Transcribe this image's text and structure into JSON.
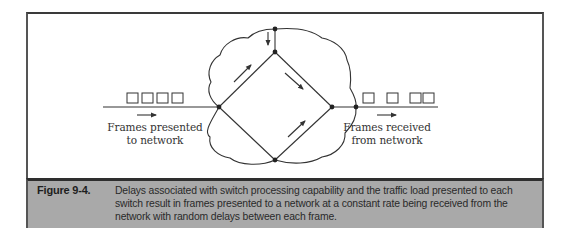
{
  "diagram": {
    "left_label": {
      "line1": "Frames presented",
      "line2": "to network"
    },
    "right_label": {
      "line1": "Frames received",
      "line2": "from network"
    },
    "left_frames_count": 4,
    "right_frames_count": 4,
    "nodes": [
      {
        "id": "cloud-top",
        "x": 275,
        "y": 29
      },
      {
        "id": "diamond-top",
        "x": 275,
        "y": 52
      },
      {
        "id": "diamond-left",
        "x": 219,
        "y": 107
      },
      {
        "id": "diamond-right",
        "x": 332,
        "y": 107
      },
      {
        "id": "diamond-bottom",
        "x": 275,
        "y": 160
      },
      {
        "id": "cloud-exit",
        "x": 356,
        "y": 107
      }
    ],
    "colors": {
      "line": "#333333",
      "caption_bg": "#a9a9a9",
      "caption_border": "#2e2e2e"
    }
  },
  "caption": {
    "figure_number": "Figure 9-4.",
    "text": "Delays associated with switch processing capability and the traffic load presented to each switch result in frames presented to a network at a constant rate being received from the network with random delays between each frame."
  }
}
